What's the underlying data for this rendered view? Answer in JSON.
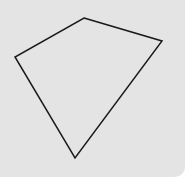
{
  "diagram": {
    "shape": "quadrilateral",
    "background_color": "#e4e4e4",
    "stroke_color": "#1a1a1a",
    "vertices": [
      {
        "x": 84,
        "y": 18
      },
      {
        "x": 162,
        "y": 41
      },
      {
        "x": 75,
        "y": 158
      },
      {
        "x": 15,
        "y": 57
      }
    ]
  }
}
